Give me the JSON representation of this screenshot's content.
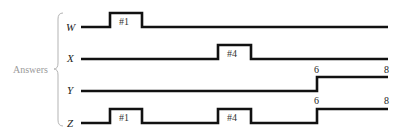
{
  "group_label": "Answers",
  "signals": [
    {
      "name": "W",
      "pulses": [
        {
          "label": "#1",
          "start": 110,
          "end": 142
        }
      ],
      "step": null
    },
    {
      "name": "X",
      "pulses": [
        {
          "label": "#4",
          "start": 218,
          "end": 251
        }
      ],
      "step": null
    },
    {
      "name": "Y",
      "pulses": [],
      "step": {
        "at": 317,
        "start_label": "6",
        "end_label": "8"
      }
    },
    {
      "name": "Z",
      "pulses": [
        {
          "label": "#1",
          "start": 110,
          "end": 142
        },
        {
          "label": "#4",
          "start": 218,
          "end": 251
        }
      ],
      "step": {
        "at": 317,
        "start_label": "6",
        "end_label": "8"
      }
    }
  ],
  "labels": {
    "w": "W",
    "x": "X",
    "y": "Y",
    "z": "Z",
    "w_pulse": "#1",
    "x_pulse": "#4",
    "z_pulse1": "#1",
    "z_pulse2": "#4",
    "y_step_start": "6",
    "y_step_end": "8",
    "z_step_start": "6",
    "z_step_end": "8"
  }
}
